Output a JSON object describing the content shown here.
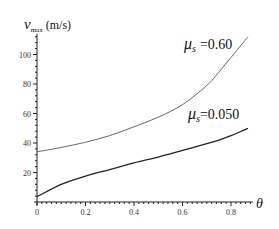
{
  "chart_data": {
    "type": "line",
    "title": "",
    "xlabel": "θ",
    "ylabel": "v_max (m/s)",
    "ylabel_main": "v",
    "ylabel_sub": "max",
    "ylabel_unit": "(m/s)",
    "xlim": [
      0,
      0.89
    ],
    "ylim": [
      0,
      114
    ],
    "grid": false,
    "legend_position": "inline labels",
    "x_ticks": [
      0,
      0.2,
      0.4,
      0.6,
      0.8
    ],
    "x_tick_labels": [
      "0",
      "0.2",
      "0.4",
      "0.6",
      "0.8"
    ],
    "y_ticks": [
      20,
      40,
      60,
      80,
      100
    ],
    "y_tick_labels": [
      "20",
      "40",
      "60",
      "80",
      "100"
    ],
    "x": [
      0,
      0.1,
      0.2,
      0.3,
      0.4,
      0.5,
      0.6,
      0.7,
      0.75,
      0.8,
      0.85,
      0.87
    ],
    "series": [
      {
        "name": "μs = 0.60",
        "label_mu": "μ",
        "label_sub": "s",
        "label_value": "=0.60",
        "color": "#555555",
        "values": [
          34,
          37,
          40.5,
          45,
          51,
          57.5,
          66,
          79,
          88,
          98,
          108,
          112
        ]
      },
      {
        "name": "μs = 0.050",
        "label_mu": "μ",
        "label_sub": "s",
        "label_value": "=0.050",
        "color": "#222222",
        "values": [
          3.6,
          12,
          17.5,
          22,
          26.5,
          30.5,
          35,
          39.5,
          42,
          45,
          48.5,
          50
        ]
      }
    ]
  }
}
